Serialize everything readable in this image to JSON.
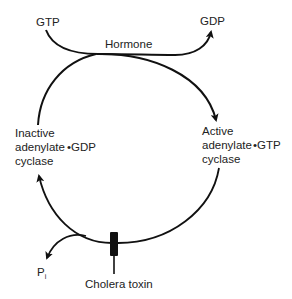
{
  "diagram": {
    "type": "cycle",
    "labels": {
      "gtp_in": "GTP",
      "gdp_out": "GDP",
      "hormone": "Hormone",
      "inactive_state": "Inactive\nadenylate\ncyclase",
      "inactive_bound": "•GDP",
      "active_state": "Active\nadenylate\ncyclase",
      "active_bound": "•GTP",
      "pi_main": "P",
      "pi_sub": "i",
      "cholera_toxin": "Cholera toxin"
    },
    "nodes": [
      {
        "id": "inactive",
        "label": "Inactive adenylate cyclase •GDP",
        "position": "left"
      },
      {
        "id": "active",
        "label": "Active adenylate cyclase •GTP",
        "position": "right"
      }
    ],
    "edges": [
      {
        "from": "inactive",
        "to": "active",
        "via": "Hormone",
        "consumes": "GTP",
        "releases": "GDP"
      },
      {
        "from": "active",
        "to": "inactive",
        "releases": "Pi",
        "blocked_by": "Cholera toxin"
      }
    ],
    "colors": {
      "line": "#111111",
      "text": "#222222",
      "background": "#ffffff"
    }
  }
}
